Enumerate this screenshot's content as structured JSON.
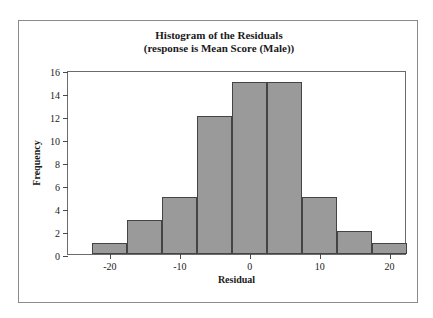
{
  "chart_data": {
    "type": "bar",
    "title": "Histogram of the Residuals",
    "subtitle": "(response is Mean Score (Male))",
    "xlabel": "Residual",
    "ylabel": "Frequency",
    "grid": false,
    "legend": "none",
    "bin_width": 5,
    "bin_edges": [
      -22.5,
      -17.5,
      -12.5,
      -7.5,
      -2.5,
      2.5,
      7.5,
      12.5,
      17.5,
      22.5
    ],
    "categories": [
      "-22.5 to -17.5",
      "-17.5 to -12.5",
      "-12.5 to -7.5",
      "-7.5 to -2.5",
      "-2.5 to 2.5",
      "2.5 to 7.5",
      "7.5 to 12.5",
      "12.5 to 17.5",
      "17.5 to 22.5"
    ],
    "bin_centers": [
      -20,
      -15,
      -10,
      -5,
      0,
      5,
      10,
      15,
      20
    ],
    "values": [
      1,
      3,
      5,
      12,
      15,
      15,
      5,
      2,
      1
    ],
    "xlim": [
      -26,
      22.5
    ],
    "ylim": [
      0,
      16
    ],
    "x_ticks": [
      -20,
      -10,
      0,
      10,
      20
    ],
    "x_tick_labels": [
      "-20",
      "-10",
      "0",
      "10",
      "20"
    ],
    "y_ticks": [
      0,
      2,
      4,
      6,
      8,
      10,
      12,
      14,
      16
    ],
    "y_tick_labels": [
      "0",
      "2",
      "4",
      "6",
      "8",
      "10",
      "12",
      "14",
      "16"
    ],
    "bar_color": "#9a9a9a",
    "bar_edge_color": "#444444"
  }
}
